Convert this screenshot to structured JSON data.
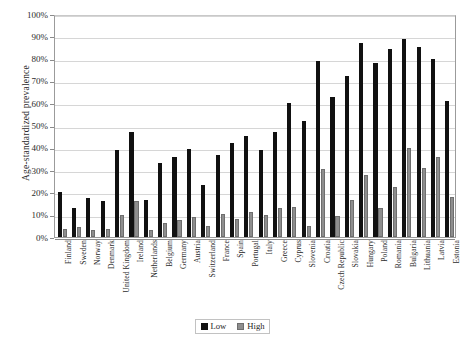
{
  "chart_data": {
    "type": "bar",
    "title": "",
    "xlabel": "",
    "ylabel": "Age-standardized prevalence",
    "ylim": [
      0,
      100
    ],
    "ytick_labels": [
      "100%",
      "90%",
      "80%",
      "70%",
      "60%",
      "50%",
      "40%",
      "30%",
      "20%",
      "10%",
      "0%"
    ],
    "ytick_values": [
      100,
      90,
      80,
      70,
      60,
      50,
      40,
      30,
      20,
      10,
      0
    ],
    "grid": true,
    "legend_position": "bottom-center",
    "categories": [
      "Finland",
      "Sweden",
      "Norway",
      "Denmark",
      "United Kingdom",
      "Ireland",
      "Netherlands",
      "Belgium",
      "Germany",
      "Austria",
      "Switzerland",
      "France",
      "Spain",
      "Portugal",
      "Italy",
      "Greece",
      "Cyprus",
      "Slovenia",
      "Croatia",
      "Czech Republic",
      "Slovakia",
      "Hungary",
      "Poland",
      "Romania",
      "Bulgaria",
      "Lithuania",
      "Latvia",
      "Estonia"
    ],
    "series": [
      {
        "name": "Low",
        "color": "#111111",
        "values": [
          20,
          13,
          17.5,
          16,
          39,
          47,
          16.5,
          33,
          36,
          39.5,
          23.5,
          37,
          42,
          45.5,
          39,
          47,
          60,
          52,
          79,
          63,
          72,
          87,
          78,
          84.5,
          89,
          85,
          80,
          61
        ]
      },
      {
        "name": "High",
        "color": "#8e8e8e",
        "values": [
          3.5,
          4.5,
          3,
          3.5,
          10,
          16,
          3,
          6.5,
          7.5,
          9,
          5,
          10.5,
          8,
          11,
          10,
          13,
          13.5,
          5,
          30.5,
          9.5,
          16.5,
          28,
          13,
          22.5,
          40,
          31,
          36,
          18
        ]
      }
    ],
    "caption": ""
  },
  "legend": {
    "items": [
      {
        "label": "Low",
        "swatch": "low"
      },
      {
        "label": "High",
        "swatch": "high"
      }
    ]
  }
}
